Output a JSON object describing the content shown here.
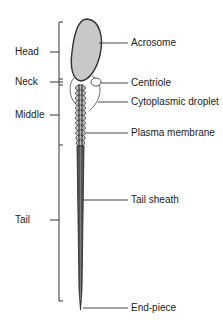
{
  "diagram": {
    "colors": {
      "head_fill": "#c8c8c8",
      "outline": "#333333",
      "background": "#ffffff"
    },
    "regions": [
      {
        "id": "head",
        "label": "Head"
      },
      {
        "id": "neck",
        "label": "Neck"
      },
      {
        "id": "middle",
        "label": "Middle"
      },
      {
        "id": "tail",
        "label": "Tail"
      }
    ],
    "parts": [
      {
        "id": "acrosome",
        "label": "Acrosome"
      },
      {
        "id": "centriole",
        "label": "Centriole"
      },
      {
        "id": "cytoplasmic_droplet",
        "label": "Cytoplasmic droplet"
      },
      {
        "id": "plasma_membrane",
        "label": "Plasma membrane"
      },
      {
        "id": "tail_sheath",
        "label": "Tail sheath"
      },
      {
        "id": "end_piece",
        "label": "End-piece"
      }
    ]
  }
}
